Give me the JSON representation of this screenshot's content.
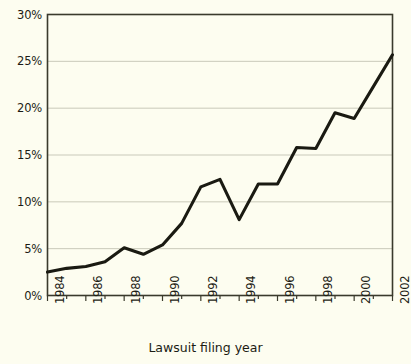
{
  "chart_data": {
    "type": "line",
    "title": "",
    "subtitle": "",
    "xlabel": "Lawsuit filing year",
    "ylabel": "",
    "xlim": [
      1984,
      2002
    ],
    "ylim": [
      0,
      30
    ],
    "grid": true,
    "grid_axis": "y",
    "legend": null,
    "legend_position": "none",
    "y_tick_labels": [
      "0%",
      "5%",
      "10%",
      "15%",
      "20%",
      "25%",
      "30%"
    ],
    "y_tick_values": [
      0,
      5,
      10,
      15,
      20,
      25,
      30
    ],
    "x_tick_labels": [
      "1984",
      "1986",
      "1988",
      "1990",
      "1992",
      "1994",
      "1996",
      "1998",
      "2000",
      "2002"
    ],
    "x_tick_values": [
      1984,
      1986,
      1988,
      1990,
      1992,
      1994,
      1996,
      1998,
      2000,
      2002
    ],
    "x_minor_tick_values": [
      1985,
      1987,
      1989,
      1991,
      1993,
      1995,
      1997,
      1999,
      2001
    ],
    "x": [
      1984,
      1985,
      1986,
      1987,
      1988,
      1989,
      1990,
      1991,
      1992,
      1993,
      1994,
      1995,
      1996,
      1997,
      1998,
      1999,
      2000,
      2001,
      2002
    ],
    "values": [
      2.5,
      2.9,
      3.1,
      3.6,
      5.1,
      4.4,
      5.4,
      7.7,
      11.6,
      12.4,
      8.1,
      11.9,
      11.9,
      15.8,
      15.7,
      19.5,
      18.9,
      22.3,
      25.7
    ],
    "series": [
      {
        "name": "Share of lawsuits",
        "values": [
          2.5,
          2.9,
          3.1,
          3.6,
          5.1,
          4.4,
          5.4,
          7.7,
          11.6,
          12.4,
          8.1,
          11.9,
          11.9,
          15.8,
          15.7,
          19.5,
          18.9,
          22.3,
          25.7
        ]
      }
    ],
    "colors": {
      "line": "#1a1a12",
      "background": "#fdfdf0",
      "grid": "#c9c9ba",
      "axis": "#3a3a2c"
    }
  }
}
